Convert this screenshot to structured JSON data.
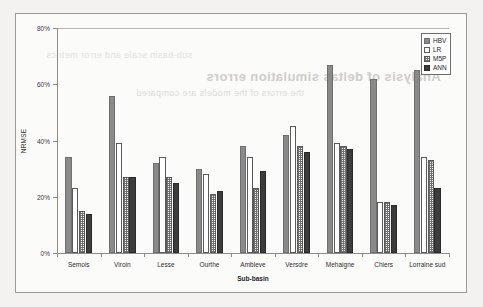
{
  "figure": {
    "background_color": "#fbfbfa",
    "border_color": "#9a9a9a",
    "ghost_text_1": "Analysis of deltas simulation errors",
    "ghost_text_2": "the errors of the models are compared",
    "ghost_text_3": "sub-basin scale and error metrics"
  },
  "legend": {
    "position": "top-right-inside",
    "entries": [
      {
        "label": "HBV",
        "color": "#8a8a8a",
        "pattern": "solid-gray"
      },
      {
        "label": "LR",
        "color": "#ffffff",
        "pattern": "hollow-white"
      },
      {
        "label": "M5P",
        "color": "#ffffff",
        "pattern": "fine-grid-dotted"
      },
      {
        "label": "ANN",
        "color": "#3c3c3c",
        "pattern": "solid-dark"
      }
    ]
  },
  "chart_data": {
    "type": "bar",
    "title": "",
    "xlabel": "Sub-basin",
    "ylabel": "NRMSE",
    "ylim": [
      0,
      80
    ],
    "ytick_labels": [
      "0%",
      "20%",
      "40%",
      "60%",
      "80%"
    ],
    "ytick_values": [
      0,
      20,
      40,
      60,
      80
    ],
    "yaxis_unit": "%",
    "grid": false,
    "legend_position": "upper right",
    "categories": [
      "Semois",
      "Viroin",
      "Lesse",
      "Ourthe",
      "Ambleve",
      "Versdre",
      "Mehaigne",
      "Chiers",
      "Lorraine sud"
    ],
    "series": [
      {
        "name": "HBV",
        "color": "#8a8a8a",
        "values": [
          34,
          56,
          32,
          30,
          38,
          42,
          67,
          62,
          65
        ]
      },
      {
        "name": "LR",
        "color": "#ffffff",
        "values": [
          23,
          39,
          34,
          28,
          34,
          45,
          39,
          18,
          34
        ]
      },
      {
        "name": "M5P",
        "color": "#ffffff",
        "values": [
          15,
          27,
          27,
          21,
          23,
          38,
          38,
          18,
          33
        ]
      },
      {
        "name": "ANN",
        "color": "#3c3c3c",
        "values": [
          14,
          27,
          25,
          22,
          29,
          36,
          37,
          17,
          23
        ]
      }
    ]
  }
}
